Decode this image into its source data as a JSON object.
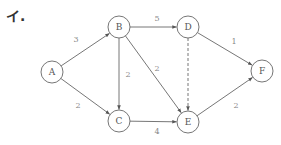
{
  "heading": "イ.",
  "nodes": [
    {
      "id": "A",
      "label": "A",
      "x": 52,
      "y": 72
    },
    {
      "id": "B",
      "label": "B",
      "x": 119,
      "y": 27
    },
    {
      "id": "C",
      "label": "C",
      "x": 119,
      "y": 121
    },
    {
      "id": "D",
      "label": "D",
      "x": 188,
      "y": 27
    },
    {
      "id": "E",
      "label": "E",
      "x": 188,
      "y": 122
    },
    {
      "id": "F",
      "label": "F",
      "x": 262,
      "y": 71
    }
  ],
  "node_radius": 11,
  "edges": [
    {
      "from": "A",
      "to": "B",
      "weight": "3",
      "style": "solid",
      "lx": 76,
      "ly": 42
    },
    {
      "from": "A",
      "to": "C",
      "weight": "2",
      "style": "solid",
      "lx": 78,
      "ly": 108
    },
    {
      "from": "B",
      "to": "C",
      "weight": "2",
      "style": "solid",
      "lx": 128,
      "ly": 77
    },
    {
      "from": "B",
      "to": "D",
      "weight": "5",
      "style": "solid",
      "lx": 157,
      "ly": 21
    },
    {
      "from": "B",
      "to": "E",
      "weight": "2",
      "style": "solid",
      "lx": 157,
      "ly": 71
    },
    {
      "from": "C",
      "to": "E",
      "weight": "4",
      "style": "solid",
      "lx": 157,
      "ly": 134
    },
    {
      "from": "D",
      "to": "E",
      "weight": "",
      "style": "dashed",
      "lx": 0,
      "ly": 0
    },
    {
      "from": "D",
      "to": "F",
      "weight": "1",
      "style": "solid",
      "lx": 234,
      "ly": 44
    },
    {
      "from": "E",
      "to": "F",
      "weight": "2",
      "style": "solid",
      "lx": 236,
      "ly": 108
    }
  ],
  "colors": {
    "stroke": "#666666",
    "label": "#888888",
    "node_text": "#555555"
  }
}
